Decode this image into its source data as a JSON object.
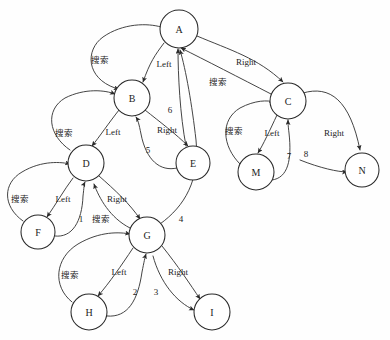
{
  "diagram": {
    "type": "directed-graph",
    "background_color": "#fefefe",
    "stroke_color": "#3a3a3a",
    "node_fill_color": "#ffffff",
    "node_stroke_color": "#2a2a2a",
    "label_color": "#1c1c1c",
    "nodes": [
      {
        "id": "A",
        "label": "A",
        "cx": 179,
        "cy": 29,
        "r": 19
      },
      {
        "id": "B",
        "label": "B",
        "cx": 132,
        "cy": 98,
        "r": 18
      },
      {
        "id": "C",
        "label": "C",
        "cx": 288,
        "cy": 101,
        "r": 18
      },
      {
        "id": "D",
        "label": "D",
        "cx": 86,
        "cy": 163,
        "r": 18
      },
      {
        "id": "E",
        "label": "E",
        "cx": 193,
        "cy": 163,
        "r": 17
      },
      {
        "id": "M",
        "label": "M",
        "cx": 256,
        "cy": 172,
        "r": 18
      },
      {
        "id": "N",
        "label": "N",
        "cx": 362,
        "cy": 170,
        "r": 17
      },
      {
        "id": "F",
        "label": "F",
        "cx": 38,
        "cy": 232,
        "r": 17
      },
      {
        "id": "G",
        "label": "G",
        "cx": 147,
        "cy": 235,
        "r": 18
      },
      {
        "id": "H",
        "label": "H",
        "cx": 89,
        "cy": 312,
        "r": 18
      },
      {
        "id": "I",
        "label": "I",
        "cx": 212,
        "cy": 312,
        "r": 18
      }
    ],
    "edge_labels": [
      {
        "id": "lbl-search-a-b",
        "text": "搜索",
        "x": 100,
        "y": 60,
        "script": "cjk",
        "from": "B",
        "to": "A"
      },
      {
        "id": "lbl-left-a-b",
        "text": "Left",
        "x": 164,
        "y": 64,
        "script": "latin",
        "from": "A",
        "to": "B"
      },
      {
        "id": "lbl-right-a-c",
        "text": "Right",
        "x": 246,
        "y": 62,
        "script": "latin",
        "from": "A",
        "to": "C"
      },
      {
        "id": "lbl-search-c-a",
        "text": "搜索",
        "x": 218,
        "y": 82,
        "script": "cjk",
        "from": "C",
        "to": "A"
      },
      {
        "id": "lbl-step-6",
        "text": "6",
        "x": 170,
        "y": 110,
        "script": "step",
        "from": "E",
        "to": "A"
      },
      {
        "id": "lbl-search-b-d",
        "text": "搜索",
        "x": 64,
        "y": 133,
        "script": "cjk",
        "from": "D",
        "to": "B"
      },
      {
        "id": "lbl-left-b-d",
        "text": "Left",
        "x": 113,
        "y": 132,
        "script": "latin",
        "from": "B",
        "to": "D"
      },
      {
        "id": "lbl-right-b-e",
        "text": "Right",
        "x": 167,
        "y": 130,
        "script": "latin",
        "from": "B",
        "to": "E"
      },
      {
        "id": "lbl-step-5",
        "text": "5",
        "x": 148,
        "y": 150,
        "script": "step",
        "from": "E",
        "to": "B"
      },
      {
        "id": "lbl-search-c-m",
        "text": "搜索",
        "x": 234,
        "y": 131,
        "script": "cjk",
        "from": "M",
        "to": "C"
      },
      {
        "id": "lbl-left-c-m",
        "text": "Left",
        "x": 272,
        "y": 133,
        "script": "latin",
        "from": "C",
        "to": "M"
      },
      {
        "id": "lbl-right-c-n",
        "text": "Right",
        "x": 334,
        "y": 133,
        "script": "latin",
        "from": "C",
        "to": "N"
      },
      {
        "id": "lbl-step-7",
        "text": "7",
        "x": 289,
        "y": 156,
        "script": "step",
        "from": "M",
        "to": "C"
      },
      {
        "id": "lbl-step-8",
        "text": "8",
        "x": 306,
        "y": 154,
        "script": "step",
        "from": "C",
        "to": "N"
      },
      {
        "id": "lbl-search-d-f",
        "text": "搜索",
        "x": 20,
        "y": 199,
        "script": "cjk",
        "from": "F",
        "to": "D"
      },
      {
        "id": "lbl-left-d-f",
        "text": "Left",
        "x": 63,
        "y": 199,
        "script": "latin",
        "from": "D",
        "to": "F"
      },
      {
        "id": "lbl-right-d-g",
        "text": "Right",
        "x": 117,
        "y": 199,
        "script": "latin",
        "from": "D",
        "to": "G"
      },
      {
        "id": "lbl-step-1",
        "text": "1",
        "x": 81,
        "y": 219,
        "script": "step",
        "from": "F",
        "to": "D"
      },
      {
        "id": "lbl-search-g-d",
        "text": "搜索",
        "x": 101,
        "y": 219,
        "script": "cjk",
        "from": "G",
        "to": "D"
      },
      {
        "id": "lbl-step-4",
        "text": "4",
        "x": 181,
        "y": 219,
        "script": "step",
        "from": "G",
        "to": "A"
      },
      {
        "id": "lbl-search-g-h",
        "text": "搜索",
        "x": 70,
        "y": 275,
        "script": "cjk",
        "from": "H",
        "to": "G"
      },
      {
        "id": "lbl-left-g-h",
        "text": "Left",
        "x": 119,
        "y": 272,
        "script": "latin",
        "from": "G",
        "to": "H"
      },
      {
        "id": "lbl-right-g-i",
        "text": "Right",
        "x": 178,
        "y": 272,
        "script": "latin",
        "from": "G",
        "to": "I"
      },
      {
        "id": "lbl-step-2",
        "text": "2",
        "x": 135,
        "y": 292,
        "script": "step",
        "from": "H",
        "to": "G"
      },
      {
        "id": "lbl-step-3",
        "text": "3",
        "x": 156,
        "y": 292,
        "script": "step",
        "from": "G",
        "to": "I"
      }
    ],
    "edges": [
      {
        "id": "edge-a-b-left",
        "from": "A",
        "to": "B",
        "label": "Left",
        "d": "M 164,43 C 155,55 150,62 143,82",
        "arrow": true
      },
      {
        "id": "edge-b-a-search",
        "from": "B",
        "to": "A",
        "label": "搜索",
        "d": "M 115,88 C 86,78 85,50 103,37 C 123,23 148,23 161,27",
        "arrow": false,
        "arrow_start": true
      },
      {
        "id": "edge-a-c-right",
        "from": "A",
        "to": "C",
        "label": "Right",
        "d": "M 197,36 C 230,50 258,58 283,82",
        "arrow": true
      },
      {
        "id": "edge-c-a-search",
        "from": "C",
        "to": "A",
        "label": "搜索",
        "d": "M 271,94 C 240,78 205,60 181,48",
        "arrow": true
      },
      {
        "id": "edge-e-a-6",
        "from": "E",
        "to": "A",
        "label": "6",
        "d": "M 186,146 C 180,115 178,75 178,49",
        "arrow": true
      },
      {
        "id": "edge-b-d-left",
        "from": "B",
        "to": "D",
        "label": "Left",
        "d": "M 119,110 C 108,124 100,136 92,146",
        "arrow": true
      },
      {
        "id": "edge-d-b-search",
        "from": "D",
        "to": "B",
        "label": "搜索",
        "d": "M 70,150 C 48,135 45,110 65,98 C 85,88 105,90 115,94",
        "arrow": true
      },
      {
        "id": "edge-b-e-right",
        "from": "B",
        "to": "E",
        "label": "Right",
        "d": "M 145,110 C 160,122 176,134 188,146",
        "arrow": true
      },
      {
        "id": "edge-e-b-5",
        "from": "E",
        "to": "B",
        "label": "5",
        "d": "M 177,168 C 160,172 146,160 141,134 C 139,124 138,120 136,117",
        "arrow": true
      },
      {
        "id": "edge-c-m-left",
        "from": "C",
        "to": "M",
        "label": "Left",
        "d": "M 277,115 C 270,130 263,145 258,153",
        "arrow": true
      },
      {
        "id": "edge-m-c-search",
        "from": "M",
        "to": "C",
        "label": "搜索",
        "d": "M 240,164 C 222,146 220,120 240,108 C 255,100 268,100 274,102",
        "arrow": true
      },
      {
        "id": "edge-c-n-right",
        "from": "C",
        "to": "N",
        "label": "Right",
        "d": "M 303,93 C 330,85 350,100 360,150",
        "arrow": true
      },
      {
        "id": "edge-m-c-7",
        "from": "M",
        "to": "C",
        "label": "7",
        "d": "M 272,180 C 288,178 292,160 289,133 C 288,125 288,122 288,120",
        "arrow": true
      },
      {
        "id": "edge-c-n-8",
        "from": "C",
        "to": "N",
        "label": "8",
        "d": "M 300,160 C 320,168 338,172 347,172",
        "arrow": true
      },
      {
        "id": "edge-d-f-left",
        "from": "D",
        "to": "F",
        "label": "Left",
        "d": "M 73,178 C 64,190 56,204 47,217",
        "arrow": true
      },
      {
        "id": "edge-f-d-search",
        "from": "F",
        "to": "D",
        "label": "搜索",
        "d": "M 23,221 C 2,206 3,183 22,172 C 42,160 62,162 70,164",
        "arrow": true
      },
      {
        "id": "edge-d-g-right",
        "from": "D",
        "to": "G",
        "label": "Right",
        "d": "M 99,176 C 115,190 130,204 140,219",
        "arrow": true
      },
      {
        "id": "edge-f-d-1",
        "from": "F",
        "to": "D",
        "label": "1",
        "d": "M 55,236 C 72,238 82,222 83,196 C 84,188 84,184 85,182",
        "arrow": true
      },
      {
        "id": "edge-g-d-search",
        "from": "G",
        "to": "D",
        "label": "搜索",
        "d": "M 130,228 C 110,218 99,198 94,184",
        "arrow": true
      },
      {
        "id": "edge-g-a-4",
        "from": "G",
        "to": "A",
        "label": "4",
        "d": "M 160,224 C 185,206 200,180 196,140 C 192,105 186,70 180,50",
        "arrow": true
      },
      {
        "id": "edge-g-h-left",
        "from": "G",
        "to": "H",
        "label": "Left",
        "d": "M 133,248 C 121,266 110,282 98,296",
        "arrow": true
      },
      {
        "id": "edge-h-g-search",
        "from": "H",
        "to": "G",
        "label": "搜索",
        "d": "M 72,302 C 52,286 55,258 78,244 C 100,231 120,232 130,234",
        "arrow": true
      },
      {
        "id": "edge-g-i-right",
        "from": "G",
        "to": "I",
        "label": "Right",
        "d": "M 162,246 C 178,266 190,284 200,299",
        "arrow": true
      },
      {
        "id": "edge-h-g-2",
        "from": "H",
        "to": "G",
        "label": "2",
        "d": "M 107,316 C 128,318 138,300 142,272 C 144,262 145,257 146,254",
        "arrow": true
      },
      {
        "id": "edge-g-i-3",
        "from": "G",
        "to": "I",
        "label": "3",
        "d": "M 153,256 C 160,282 176,302 194,310",
        "arrow": true
      }
    ]
  }
}
